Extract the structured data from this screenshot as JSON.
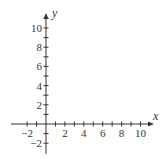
{
  "chart_data": {
    "type": "scatter",
    "title": "",
    "xlabel": "x",
    "ylabel": "y",
    "xlim": [
      -3.5,
      11
    ],
    "ylim": [
      -3,
      11
    ],
    "grid": false,
    "x_ticks": [
      -2,
      -1,
      1,
      2,
      3,
      4,
      5,
      6,
      7,
      8,
      9,
      10
    ],
    "x_tick_labels": [
      "-2",
      "2",
      "4",
      "6",
      "8",
      "10"
    ],
    "x_tick_label_values": [
      -2,
      2,
      4,
      6,
      8,
      10
    ],
    "y_ticks": [
      -2,
      -1,
      1,
      2,
      3,
      4,
      5,
      6,
      7,
      8,
      9,
      10,
      11
    ],
    "y_tick_labels": [
      "-2",
      "2",
      "4",
      "6",
      "8",
      "10"
    ],
    "y_tick_label_values": [
      -2,
      2,
      4,
      6,
      8,
      10
    ],
    "series": []
  },
  "axes": {
    "x_label": "x",
    "y_label": "y",
    "color": "#333333"
  }
}
